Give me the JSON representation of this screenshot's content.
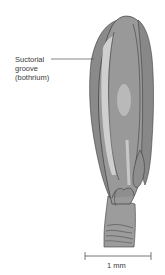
{
  "figure": {
    "label": {
      "line1": "Suctorial",
      "line2": "groove",
      "line3": "(bothrium)"
    },
    "scale_bar": {
      "label": "1 mm"
    },
    "colors": {
      "body_dark": "#7d7d7d",
      "body_mid": "#9a9a9a",
      "body_light": "#b8b8b8",
      "groove_highlight": "#cfcfcf",
      "outline": "#3c3c3c",
      "text": "#3a3a3a"
    }
  }
}
